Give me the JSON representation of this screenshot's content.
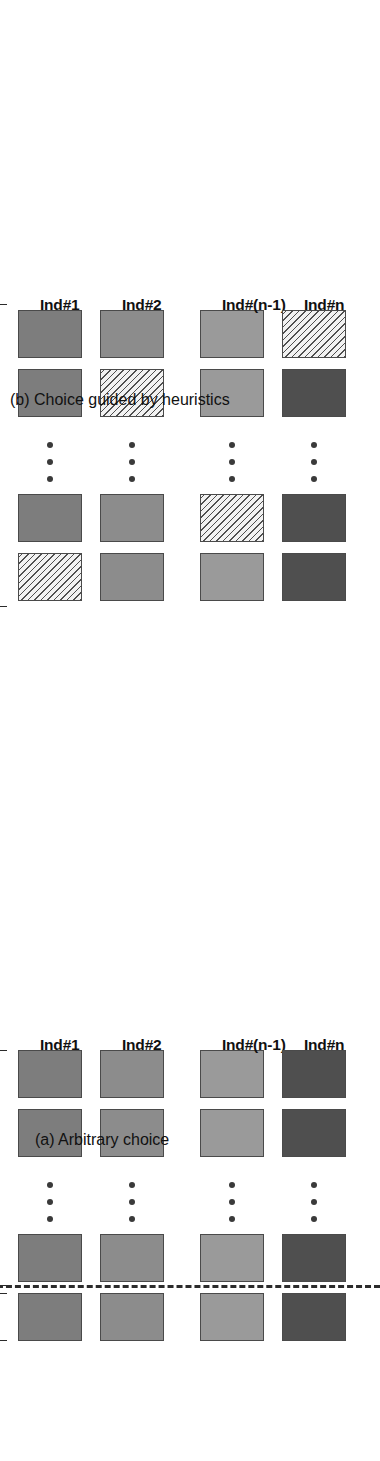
{
  "figure": {
    "orientation": "rotated-90-ccw",
    "panels": [
      {
        "id": "a",
        "caption": "(a) Arbitrary choice",
        "column_labels": [
          "Ind#1",
          "Ind#2",
          "Ind#(n-1)",
          "Ind#n"
        ],
        "bracket_labels": {
          "reference": "Reference\nsample",
          "test": "M-1 test sample"
        },
        "has_dashed_separator": true,
        "rows_per_column": 4,
        "row_fills": [
          "#7d7d7d",
          "#8c8c8c",
          "#9a9a9a",
          "#4f4f4f"
        ],
        "hatched_index_per_column": [
          null,
          null,
          null,
          null
        ],
        "ellipsis_dots": 3
      },
      {
        "id": "b",
        "caption": "(b) Choice guided by heuristics",
        "column_labels": [
          "Ind#1",
          "Ind#2",
          "Ind#(n-1)",
          "Ind#n"
        ],
        "bracket_labels": {
          "legend": "Reference\nsample",
          "test": "M-1 remaining\ntest samples"
        },
        "has_dashed_separator": false,
        "rows_per_column": 4,
        "row_fills": [
          "#7d7d7d",
          "#8c8c8c",
          "#9a9a9a",
          "#4f4f4f"
        ],
        "hatched_index_per_column": [
          0,
          2,
          1,
          3
        ],
        "ellipsis_dots": 3
      }
    ],
    "colors": {
      "hatch_line": "#4f4f4f",
      "hatch_background": "#ededed",
      "box_border": "#4a4a4a",
      "bracket": "#2b2b2b",
      "dashed_line": "#2b2b2b",
      "text": "#111111",
      "background": "#ffffff"
    }
  }
}
